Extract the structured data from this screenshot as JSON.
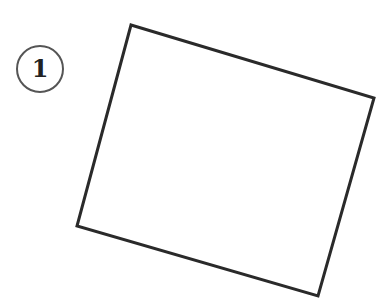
{
  "figure": {
    "step_badge": {
      "label": "1",
      "center": [
        40,
        69
      ],
      "radius": 23,
      "stroke_color": "#555555",
      "text_color": "#222222"
    },
    "shape": {
      "type": "rotated-rectangle",
      "points": [
        [
          131,
          25
        ],
        [
          374,
          98
        ],
        [
          318,
          296
        ],
        [
          77,
          226
        ]
      ],
      "stroke_color": "#2a2a2a",
      "fill_color": "#ffffff",
      "stroke_width": 3
    }
  }
}
